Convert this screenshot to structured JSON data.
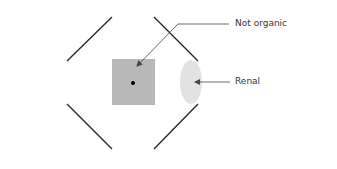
{
  "diagram": {
    "labels": {
      "not_organic": "Not organic",
      "renal": "Renal"
    },
    "colors": {
      "background": "#ffffff",
      "bracket_lines": "#222222",
      "square_fill": "#b8b8b8",
      "ellipse_fill": "#e2e2e2",
      "dot": "#000000",
      "leader_lines": "#444444",
      "text": "#333333"
    }
  }
}
